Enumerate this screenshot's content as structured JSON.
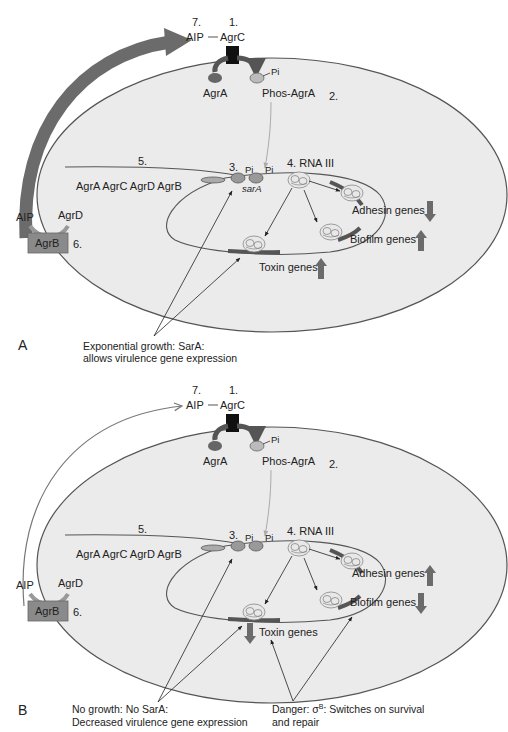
{
  "figure": {
    "colors": {
      "cell_fill": "#ebebeb",
      "cell_stroke": "#555555",
      "arrow_dark": "#6b6b6b",
      "agr_box": "#8a8a8a",
      "text": "#222222"
    },
    "panels": [
      {
        "id": "A",
        "panel_label": "A",
        "top": {
          "num7": "7.",
          "num1": "1.",
          "aip": "AIP",
          "agrc": "AgrC",
          "dash": "—"
        },
        "membrane": {
          "agra": "AgrA",
          "pi": "Pi",
          "phos_agra": "Phos-AgrA",
          "num2": "2."
        },
        "operon": {
          "num5": "5.",
          "genes": "AgrA AgrC AgrD AgrB"
        },
        "agrb_box": {
          "aip": "AIP",
          "agrd": "AgrD",
          "agrb": "AgrB",
          "num6": "6."
        },
        "promoter": {
          "num3": "3.",
          "pi1": "Pi",
          "pi2": "Pi",
          "sara": "sarA"
        },
        "rna": {
          "label": "4. RNA III"
        },
        "genes": {
          "adhesin": {
            "label": "Adhesin genes",
            "direction": "down"
          },
          "biofilm": {
            "label": "Biofilm genes",
            "direction": "up"
          },
          "toxin": {
            "label": "Toxin genes",
            "direction": "up"
          }
        },
        "captions": [
          {
            "line1": "Exponential growth: SarA:",
            "line2": "allows virulence gene expression"
          }
        ]
      },
      {
        "id": "B",
        "panel_label": "B",
        "top": {
          "num7": "7.",
          "num1": "1.",
          "aip": "AIP",
          "agrc": "AgrC",
          "dash": "—"
        },
        "membrane": {
          "agra": "AgrA",
          "pi": "Pi",
          "phos_agra": "Phos-AgrA",
          "num2": "2."
        },
        "operon": {
          "num5": "5.",
          "genes": "AgrA AgrC AgrD AgrB"
        },
        "agrb_box": {
          "aip": "AIP",
          "agrd": "AgrD",
          "agrb": "AgrB",
          "num6": "6."
        },
        "promoter": {
          "num3": "3.",
          "pi1": "Pi",
          "pi2": "Pi"
        },
        "rna": {
          "label": "4. RNA III"
        },
        "genes": {
          "adhesin": {
            "label": "Adhesin genes",
            "direction": "up"
          },
          "biofilm": {
            "label": "Biofilm genes",
            "direction": "down"
          },
          "toxin": {
            "label": "Toxin genes",
            "direction": "down"
          }
        },
        "captions": [
          {
            "line1": "No growth: No SarA:",
            "line2": "Decreased virulence gene expression"
          },
          {
            "line1_prefix": "Danger: ",
            "sigma": "σ",
            "sigma_sup": "B",
            "line1_suffix": ": Switches on survival",
            "line2": "and repair"
          }
        ]
      }
    ]
  }
}
